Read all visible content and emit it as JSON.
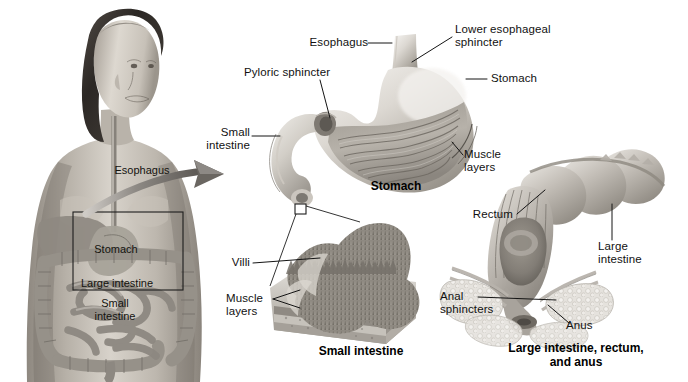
{
  "figure": {
    "background_color": "#ffffff",
    "width": 688,
    "height": 382,
    "style": "grayscale medical illustration"
  },
  "body_panel": {
    "description": "Young woman, front view, torso cutaway showing digestive organs",
    "labels": [
      {
        "id": "esophagus",
        "text": "Esophagus"
      },
      {
        "id": "stomach",
        "text": "Stomach"
      },
      {
        "id": "large-intestine",
        "text": "Large intestine"
      },
      {
        "id": "small-intestine",
        "text": "Small\nintestine"
      }
    ],
    "callout_box": {
      "present": true
    },
    "arrow": {
      "present": true,
      "direction": "right",
      "color": "#6e6e6e"
    }
  },
  "stomach_panel": {
    "caption": "Stomach",
    "labels": [
      {
        "id": "esophagus",
        "text": "Esophagus"
      },
      {
        "id": "lower-esophageal-sphincter",
        "text": "Lower esophageal\nsphincter"
      },
      {
        "id": "stomach",
        "text": "Stomach"
      },
      {
        "id": "muscle-layers",
        "text": "Muscle\nlayers"
      },
      {
        "id": "pyloric-sphincter",
        "text": "Pyloric sphincter"
      },
      {
        "id": "small-intestine",
        "text": "Small\nintestine"
      }
    ]
  },
  "small_intestine_panel": {
    "caption": "Small intestine",
    "labels": [
      {
        "id": "villi",
        "text": "Villi"
      },
      {
        "id": "muscle-layers",
        "text": "Muscle\nlayers"
      }
    ]
  },
  "large_intestine_panel": {
    "caption": "Large intestine, rectum,\nand anus",
    "labels": [
      {
        "id": "rectum",
        "text": "Rectum"
      },
      {
        "id": "large-intestine",
        "text": "Large\nintestine"
      },
      {
        "id": "anal-sphincters",
        "text": "Anal\nsphincters"
      },
      {
        "id": "anus",
        "text": "Anus"
      }
    ]
  },
  "colors": {
    "ink": "#111111",
    "leader_line": "#1a1a1a",
    "tissue_light": "#e8e6e2",
    "tissue_mid": "#b9b5ae",
    "tissue_dark": "#7d7a74",
    "skin_light": "#d9d4cd",
    "skin_mid": "#a8a29a",
    "hair_dark": "#312e2b"
  }
}
